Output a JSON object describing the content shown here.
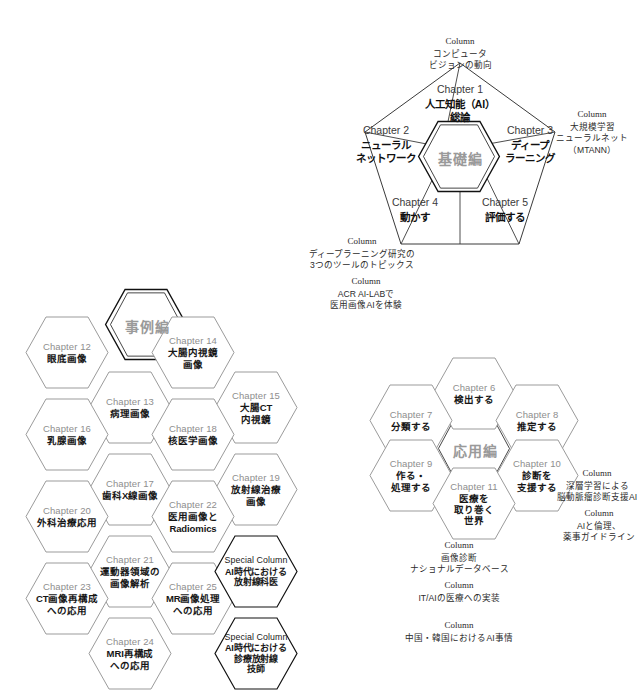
{
  "diagram": {
    "colors": {
      "hex_stroke_light": "#9b9b9b",
      "hex_stroke_dark": "#1a1a1a",
      "chapter_num": "#8e8e8e",
      "core_label": "#9a9a9a",
      "pentagon_stroke": "#3a3a3a"
    }
  },
  "pentagon": {
    "core": {
      "label": "基礎編"
    },
    "sectors": [
      {
        "num": "Chapter 1",
        "name": "人工知能（AI）\n総論"
      },
      {
        "num": "Chapter 2",
        "name": "ニューラル\nネットワーク"
      },
      {
        "num": "Chapter 3",
        "name": "ディープ\nラーニング"
      },
      {
        "num": "Chapter 4",
        "name": "動かす"
      },
      {
        "num": "Chapter 5",
        "name": "評価する"
      }
    ],
    "columns": [
      {
        "head": "Column",
        "body": "コンピュータ\nビジョンの動向"
      },
      {
        "head": "Column",
        "body": "大規模学習\nニューラルネット\n（MTANN）"
      },
      {
        "head": "Column",
        "body": "ディープラーニング研究の\n3つのツールのトピックス"
      },
      {
        "head": "Column",
        "body": "ACR AI-LABで\n医用画像AIを体験"
      }
    ]
  },
  "case_cluster": {
    "core": {
      "label": "事例編"
    },
    "hexes": [
      {
        "num": "Chapter 12",
        "name": "眼底画像"
      },
      {
        "num": "Chapter 13",
        "name": "病理画像"
      },
      {
        "num": "Chapter 14",
        "name": "大腸内視鏡\n画像"
      },
      {
        "num": "Chapter 15",
        "name": "大腸CT\n内視鏡"
      },
      {
        "num": "Chapter 16",
        "name": "乳腺画像"
      },
      {
        "num": "Chapter 17",
        "name": "歯科X線画像"
      },
      {
        "num": "Chapter 18",
        "name": "核医学画像"
      },
      {
        "num": "Chapter 19",
        "name": "放射線治療\n画像"
      },
      {
        "num": "Chapter 20",
        "name": "外科治療応用"
      },
      {
        "num": "Chapter 21",
        "name": "運動器領域の\n画像解析"
      },
      {
        "num": "Chapter 22",
        "name": "医用画像と\nRadiomics"
      },
      {
        "num": "Chapter 23",
        "name": "CT画像再構成\nへの応用"
      },
      {
        "num": "Chapter 24",
        "name": "MRI再構成\nへの応用"
      },
      {
        "num": "Chapter 25",
        "name": "MR画像処理\nへの応用"
      },
      {
        "num": "Special Column",
        "name": "AI時代における\n放射線科医"
      },
      {
        "num": "Special Column",
        "name": "AI時代における\n診療放射線\n技師"
      }
    ]
  },
  "application_cluster": {
    "core": {
      "label": "応用編"
    },
    "hexes": [
      {
        "num": "Chapter 6",
        "name": "検出する"
      },
      {
        "num": "Chapter 7",
        "name": "分類する"
      },
      {
        "num": "Chapter 8",
        "name": "推定する"
      },
      {
        "num": "Chapter 9",
        "name": "作る・\n処理する"
      },
      {
        "num": "Chapter 10",
        "name": "診断を\n支援する"
      },
      {
        "num": "Chapter 11",
        "name": "医療を\n取り巻く\n世界"
      }
    ],
    "columns": [
      {
        "head": "Column",
        "body": "深層学習による\n脳動脈瘤診断支援AI"
      },
      {
        "head": "Column",
        "body": "AIと倫理、\n薬事ガイドライン"
      },
      {
        "head": "Column",
        "body": "画像診断\nナショナルデータベース"
      },
      {
        "head": "Column",
        "body": "IT/AIの医療への実装"
      },
      {
        "head": "Column",
        "body": "中国・韓国におけるAI事情"
      }
    ]
  }
}
